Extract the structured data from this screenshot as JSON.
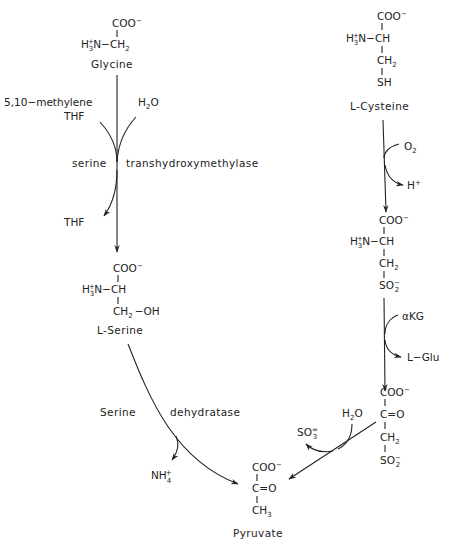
{
  "glycine": {
    "coo": "COO",
    "charge": "−",
    "amine": "H",
    "amine_plus": "+",
    "amine_sub": "3",
    "amine_rest": "N−CH",
    "ch2_sub": "2",
    "name": "Glycine"
  },
  "step1": {
    "cofactor_in": "5,10−methylene",
    "cofactor_in_2": "THF",
    "water": "H",
    "water_sub": "2",
    "water_o": "O",
    "enzyme_left": "serine",
    "enzyme_right": "transhydroxymethylase",
    "cofactor_out": "THF"
  },
  "serine": {
    "coo": "COO",
    "charge": "−",
    "amine": "H",
    "amine_plus": "+",
    "amine_sub": "3",
    "amine_rest": "N−CH",
    "ch2": "CH",
    "ch2_sub": "2",
    "oh": "−OH",
    "name": "L-Serine"
  },
  "step2": {
    "enzyme_left": "Serine",
    "enzyme_right": "dehydratase",
    "product_out": "NH",
    "product_sub": "4",
    "product_plus": "+"
  },
  "cysteine": {
    "coo": "COO",
    "charge": "−",
    "amine": "H",
    "amine_plus": "+",
    "amine_sub": "3",
    "amine_rest": "N−CH",
    "ch2": "CH",
    "ch2_sub": "2",
    "sh": "SH",
    "name": "L-Cysteine"
  },
  "step3": {
    "in": "O",
    "in_sub": "2",
    "out": "H",
    "out_plus": "+"
  },
  "cysteine_sulfinate": {
    "coo": "COO",
    "charge": "−",
    "amine": "H",
    "amine_plus": "+",
    "amine_sub": "3",
    "amine_rest": "N−CH",
    "ch2": "CH",
    "ch2_sub": "2",
    "so2": "SO",
    "so2_sub": "2",
    "so2_charge": "−"
  },
  "step4": {
    "in": "αKG",
    "out": "L−Glu"
  },
  "sulfinylpyruvate": {
    "coo": "COO",
    "charge": "−",
    "keto": "C=O",
    "ch2": "CH",
    "ch2_sub": "2",
    "so2": "SO",
    "so2_sub": "2",
    "so2_charge": "−"
  },
  "step5": {
    "water": "H",
    "water_sub": "2",
    "water_o": "O",
    "out": "SO",
    "out_sub": "3",
    "out_charge": "="
  },
  "pyruvate": {
    "coo": "COO",
    "charge": "−",
    "keto": "C=O",
    "ch3": "CH",
    "ch3_sub": "3",
    "name": "Pyruvate"
  }
}
